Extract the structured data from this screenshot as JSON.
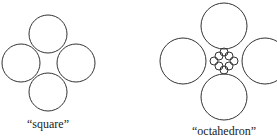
{
  "figures": [
    {
      "id": "square",
      "caption": "“square”",
      "center": [
        48,
        63
      ],
      "big_radius": 19,
      "big_circles": [
        [
          48,
          34
        ],
        [
          21,
          63
        ],
        [
          76,
          63
        ],
        [
          48,
          92
        ]
      ],
      "small_circles": []
    },
    {
      "id": "octahedron",
      "caption": "“octahedron”",
      "center": [
        224,
        61
      ],
      "big_radius": 23,
      "big_circles": [
        [
          224,
          26
        ],
        [
          183,
          61
        ],
        [
          265,
          61
        ],
        [
          224,
          97
        ]
      ],
      "small_radius": 4,
      "small_circles": [
        [
          219,
          56
        ],
        [
          229,
          56
        ],
        [
          219,
          66
        ],
        [
          229,
          66
        ],
        [
          224,
          52
        ],
        [
          224,
          70
        ],
        [
          214,
          61
        ],
        [
          234,
          61
        ]
      ]
    }
  ]
}
